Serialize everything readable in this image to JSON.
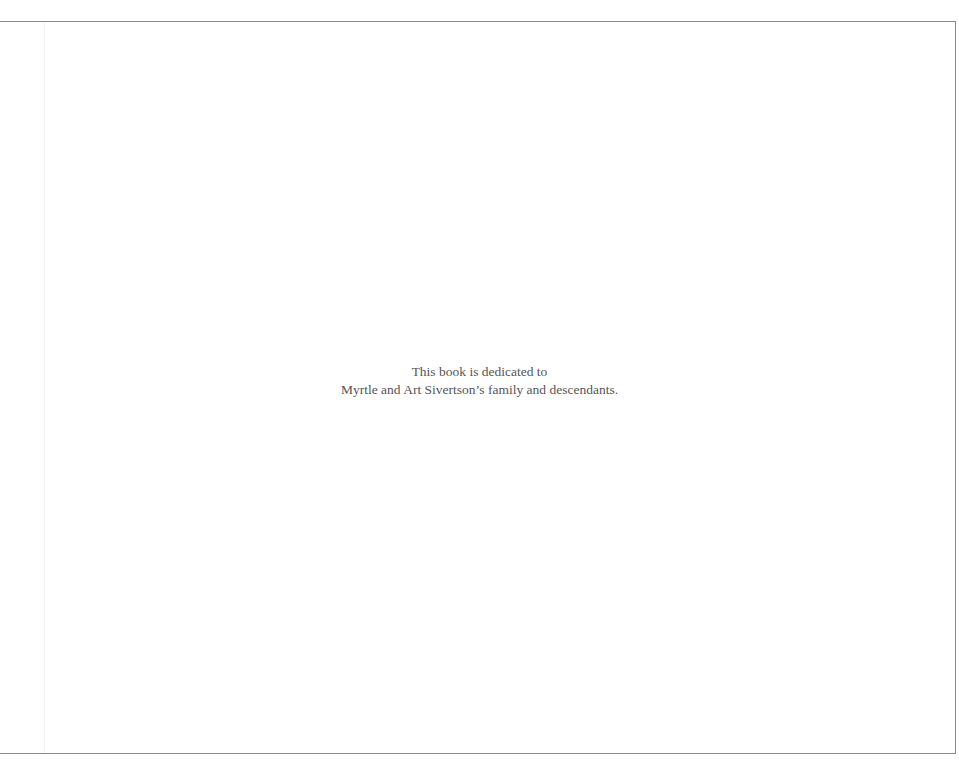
{
  "page": {
    "dedication": {
      "line1": "This book is dedicated to",
      "line2": "Myrtle and Art Sivertson’s family and descendants."
    }
  },
  "colors": {
    "background": "#ffffff",
    "rule": "#8a8a8a",
    "text": "#555555"
  }
}
